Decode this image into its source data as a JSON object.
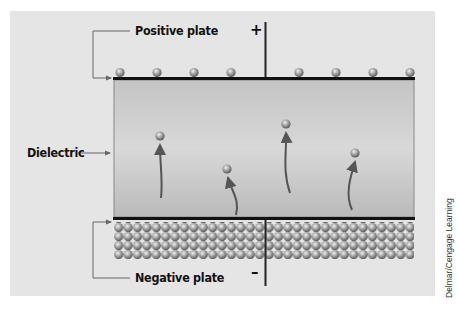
{
  "diagram": {
    "labels": {
      "positive_plate": "Positive plate",
      "negative_plate": "Negative plate",
      "dielectric": "Dielectric"
    },
    "terminals": {
      "positive_sign": "+",
      "negative_sign": "–"
    },
    "positive_plate_charges": 8,
    "negative_plate_charge_rows": 4,
    "dielectric_particles": 4,
    "credit": "Delmar/Cengage Learning"
  },
  "colors": {
    "panel_background": "#e5e5e5",
    "plate_line": "#111111",
    "dielectric_top": "#c6c6c6",
    "dielectric_mid": "#d6d6d6",
    "dielectric_bottom": "#bdbdbd",
    "sphere_light": "#e8e8e8",
    "sphere_dark": "#6e6e6e",
    "arrow": "#555555",
    "leader_line": "#666666"
  }
}
